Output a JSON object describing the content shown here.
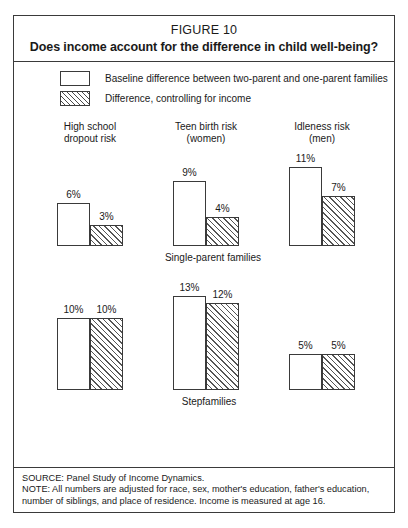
{
  "figure": {
    "number_label": "FIGURE 10",
    "title": "Does income account for the difference in child well-being?"
  },
  "legend": {
    "items": [
      {
        "swatch": "white-box",
        "label": "Baseline difference between two-parent and one-parent families"
      },
      {
        "swatch": "hatched-box",
        "label": "Difference, controlling for income"
      }
    ]
  },
  "columns": [
    {
      "line1": "High school",
      "line2": "dropout risk"
    },
    {
      "line1": "Teen birth risk",
      "line2": "(women)"
    },
    {
      "line1": "Idleness risk",
      "line2": "(men)"
    }
  ],
  "rows": [
    {
      "caption": "Single-parent families",
      "groups": [
        {
          "baseline": "6%",
          "controlled": "3%"
        },
        {
          "baseline": "9%",
          "controlled": "4%"
        },
        {
          "baseline": "11%",
          "controlled": "7%"
        }
      ]
    },
    {
      "caption": "Stepfamilies",
      "groups": [
        {
          "baseline": "10%",
          "controlled": "10%"
        },
        {
          "baseline": "13%",
          "controlled": "12%"
        },
        {
          "baseline": "5%",
          "controlled": "5%"
        }
      ]
    }
  ],
  "footer": {
    "source": "SOURCE: Panel Study of Income Dynamics.",
    "note": "NOTE: All numbers are adjusted for race, sex, mother's education, father's education, number of siblings, and place of residence. Income is measured at age 16."
  },
  "colors": {
    "frame": "#3a3a3a",
    "hatch": "#4a4a4a",
    "text": "#1a1a1a",
    "background": "#ffffff"
  },
  "chart_data": {
    "type": "bar",
    "title": "Does income account for the difference in child well-being?",
    "subtitle": "FIGURE 10",
    "xlabel": "",
    "ylabel": "Percentage-point difference",
    "ylim": [
      0,
      14
    ],
    "grid": false,
    "legend_position": "top-left",
    "units": "percent",
    "categories": [
      "High school dropout risk",
      "Teen birth risk (women)",
      "Idleness risk (men)"
    ],
    "panels": [
      {
        "name": "Single-parent families",
        "series": [
          {
            "name": "Baseline difference between two-parent and one-parent families",
            "values": [
              6,
              9,
              11
            ]
          },
          {
            "name": "Difference, controlling for income",
            "values": [
              3,
              4,
              7
            ]
          }
        ]
      },
      {
        "name": "Stepfamilies",
        "series": [
          {
            "name": "Baseline difference between two-parent and one-parent families",
            "values": [
              10,
              13,
              5
            ]
          },
          {
            "name": "Difference, controlling for income",
            "values": [
              10,
              12,
              5
            ]
          }
        ]
      }
    ],
    "annotations": [
      "SOURCE: Panel Study of Income Dynamics.",
      "NOTE: All numbers are adjusted for race, sex, mother's education, father's education, number of siblings, and place of residence. Income is measured at age 16."
    ]
  },
  "scale": {
    "px_per_unit": 7.2,
    "max_unit": 13
  }
}
